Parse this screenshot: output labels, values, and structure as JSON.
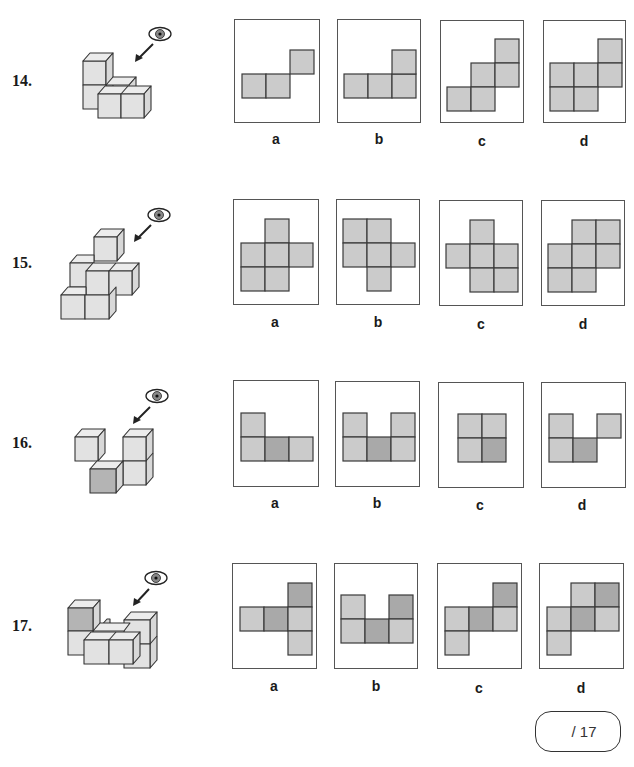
{
  "colors": {
    "cell_light": "#cbcbcb",
    "cell_dark": "#a9a9a9",
    "cell_border": "#3a3a3a",
    "cube_face": "#e2e2e2",
    "cube_top": "#ececec",
    "cube_side": "#d8d8d8",
    "cube_dark_face": "#b4b4b4"
  },
  "questions": [
    {
      "number": "14.",
      "options": [
        {
          "label": "a",
          "cells": [
            [
              0,
              1,
              "l"
            ],
            [
              1,
              1,
              "l"
            ],
            [
              2,
              0,
              "l"
            ]
          ]
        },
        {
          "label": "b",
          "cells": [
            [
              0,
              1,
              "l"
            ],
            [
              1,
              1,
              "l"
            ],
            [
              2,
              1,
              "l"
            ],
            [
              2,
              0,
              "l"
            ]
          ]
        },
        {
          "label": "c",
          "cells": [
            [
              2,
              0,
              "l"
            ],
            [
              1,
              1,
              "l"
            ],
            [
              2,
              1,
              "l"
            ],
            [
              0,
              2,
              "l"
            ],
            [
              1,
              2,
              "l"
            ]
          ]
        },
        {
          "label": "d",
          "cells": [
            [
              2,
              0,
              "l"
            ],
            [
              0,
              1,
              "l"
            ],
            [
              1,
              1,
              "l"
            ],
            [
              2,
              1,
              "l"
            ],
            [
              0,
              2,
              "l"
            ],
            [
              1,
              2,
              "l"
            ]
          ]
        }
      ]
    },
    {
      "number": "15.",
      "options": [
        {
          "label": "a",
          "cells": [
            [
              1,
              0,
              "l"
            ],
            [
              0,
              1,
              "l"
            ],
            [
              1,
              1,
              "l"
            ],
            [
              2,
              1,
              "l"
            ],
            [
              0,
              2,
              "l"
            ],
            [
              1,
              2,
              "l"
            ]
          ]
        },
        {
          "label": "b",
          "cells": [
            [
              0,
              0,
              "l"
            ],
            [
              1,
              0,
              "l"
            ],
            [
              0,
              1,
              "l"
            ],
            [
              1,
              1,
              "l"
            ],
            [
              2,
              1,
              "l"
            ],
            [
              1,
              2,
              "l"
            ]
          ]
        },
        {
          "label": "c",
          "cells": [
            [
              1,
              0,
              "l"
            ],
            [
              0,
              1,
              "l"
            ],
            [
              1,
              1,
              "l"
            ],
            [
              2,
              1,
              "l"
            ],
            [
              1,
              2,
              "l"
            ],
            [
              2,
              2,
              "l"
            ]
          ]
        },
        {
          "label": "d",
          "cells": [
            [
              1,
              0,
              "l"
            ],
            [
              2,
              0,
              "l"
            ],
            [
              0,
              1,
              "l"
            ],
            [
              1,
              1,
              "l"
            ],
            [
              2,
              1,
              "l"
            ],
            [
              0,
              2,
              "l"
            ],
            [
              1,
              2,
              "l"
            ]
          ]
        }
      ]
    },
    {
      "number": "16.",
      "options": [
        {
          "label": "a",
          "cells": [
            [
              0,
              0,
              "l"
            ],
            [
              0,
              1,
              "l"
            ],
            [
              1,
              1,
              "d"
            ],
            [
              2,
              1,
              "l"
            ]
          ]
        },
        {
          "label": "b",
          "cells": [
            [
              0,
              0,
              "l"
            ],
            [
              2,
              0,
              "l"
            ],
            [
              0,
              1,
              "l"
            ],
            [
              1,
              1,
              "d"
            ],
            [
              2,
              1,
              "l"
            ]
          ]
        },
        {
          "label": "c",
          "cells": [
            [
              0,
              0,
              "l"
            ],
            [
              1,
              0,
              "l"
            ],
            [
              0,
              1,
              "l"
            ],
            [
              1,
              1,
              "d"
            ]
          ]
        },
        {
          "label": "d",
          "cells": [
            [
              0,
              0,
              "l"
            ],
            [
              2,
              0,
              "l"
            ],
            [
              0,
              1,
              "l"
            ],
            [
              1,
              1,
              "d"
            ]
          ]
        }
      ]
    },
    {
      "number": "17.",
      "options": [
        {
          "label": "a",
          "cells": [
            [
              2,
              0,
              "d"
            ],
            [
              0,
              1,
              "l"
            ],
            [
              1,
              1,
              "d"
            ],
            [
              2,
              1,
              "l"
            ],
            [
              2,
              2,
              "l"
            ]
          ]
        },
        {
          "label": "b",
          "cells": [
            [
              0,
              0,
              "l"
            ],
            [
              2,
              0,
              "d"
            ],
            [
              0,
              1,
              "l"
            ],
            [
              1,
              1,
              "d"
            ],
            [
              2,
              1,
              "l"
            ]
          ]
        },
        {
          "label": "c",
          "cells": [
            [
              2,
              0,
              "d"
            ],
            [
              0,
              1,
              "l"
            ],
            [
              1,
              1,
              "d"
            ],
            [
              2,
              1,
              "l"
            ],
            [
              0,
              2,
              "l"
            ]
          ]
        },
        {
          "label": "d",
          "cells": [
            [
              1,
              0,
              "l"
            ],
            [
              2,
              0,
              "d"
            ],
            [
              0,
              1,
              "l"
            ],
            [
              1,
              1,
              "d"
            ],
            [
              2,
              1,
              "l"
            ],
            [
              0,
              2,
              "l"
            ]
          ]
        }
      ]
    }
  ],
  "score": {
    "text": "/ 17"
  }
}
